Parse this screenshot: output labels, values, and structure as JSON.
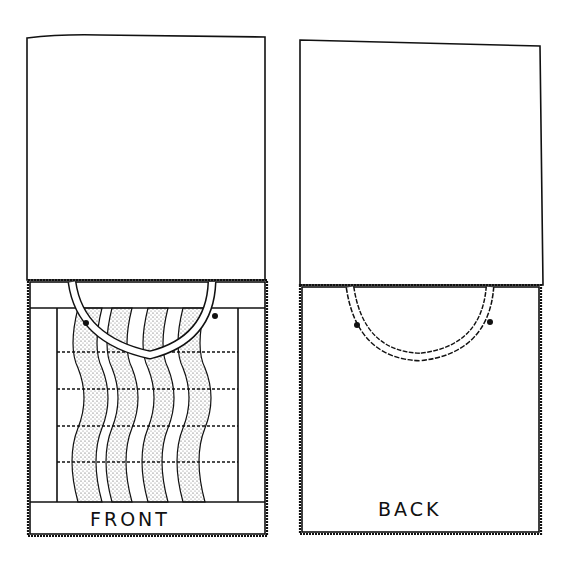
{
  "diagram": {
    "panels": [
      {
        "id": "front",
        "label": "FRONT"
      },
      {
        "id": "back",
        "label": "BACK"
      }
    ],
    "colors": {
      "ink": "#111111",
      "paper": "#ffffff",
      "stipple": "#555555"
    }
  }
}
